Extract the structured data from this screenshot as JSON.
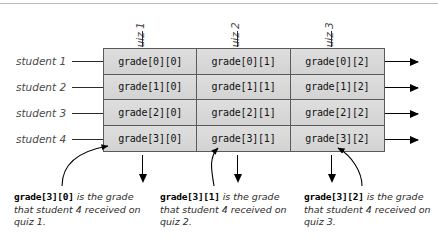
{
  "diagram": {
    "row_labels": [
      "student 1",
      "student 2",
      "student 3",
      "student 4"
    ],
    "column_labels": [
      "quiz 1",
      "quiz 2",
      "quiz 3"
    ],
    "cells": [
      [
        "grade[0][0]",
        "grade[0][1]",
        "grade[0][2]"
      ],
      [
        "grade[1][0]",
        "grade[1][1]",
        "grade[1][2]"
      ],
      [
        "grade[2][0]",
        "grade[2][1]",
        "grade[2][2]"
      ],
      [
        "grade[3][0]",
        "grade[3][1]",
        "grade[3][2]"
      ]
    ],
    "captions": [
      {
        "code": "grade[3][0]",
        "text": " is the grade that student 4 received on quiz 1."
      },
      {
        "code": "grade[3][1]",
        "text": " is the grade that student 4 received on quiz 2."
      },
      {
        "code": "grade[3][2]",
        "text": " is the grade that student 4 received on quiz 3."
      }
    ],
    "colors": {
      "cell_fill": "#d9d9d9",
      "cell_border": "#5a5a5a",
      "label_text": "#4a4a4a",
      "arrow": "#000000",
      "background": "#ffffff"
    }
  }
}
